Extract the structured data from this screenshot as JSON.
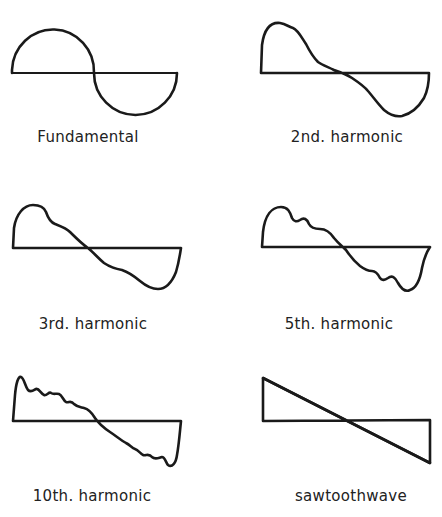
{
  "figure": {
    "panels": [
      {
        "id": "fundamental",
        "label": "Fundamental"
      },
      {
        "id": "2nd",
        "label": "2nd. harmonic"
      },
      {
        "id": "3rd",
        "label": "3rd. harmonic"
      },
      {
        "id": "5th",
        "label": "5th. harmonic"
      },
      {
        "id": "10th",
        "label": "10th. harmonic"
      },
      {
        "id": "sawtooth",
        "label": "sawtoothwave"
      }
    ],
    "colors": {
      "ink": "#1a1a1a",
      "background": "#ffffff"
    }
  }
}
